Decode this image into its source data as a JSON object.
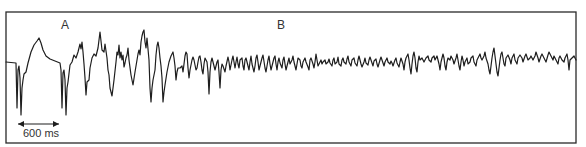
{
  "chart_data": {
    "type": "line",
    "title": "",
    "xlabel": "",
    "ylabel": "",
    "grid": false,
    "legend": null,
    "annotations": [
      {
        "text": "A",
        "x": 65,
        "y": 25,
        "meaning": "segment A: large irregular oscillations"
      },
      {
        "text": "B",
        "x": 281,
        "y": 25,
        "meaning": "segment B: smaller faster regular oscillations"
      },
      {
        "text": "600 ms",
        "type": "time-scale-bar",
        "x1": 18,
        "x2": 59,
        "y": 124
      }
    ],
    "frame": {
      "x": 6,
      "y": 12,
      "width": 570,
      "height": 131
    },
    "segments": [
      {
        "name": "A",
        "x_range_px": [
          6,
          205
        ],
        "description": "high-amplitude irregular waveform"
      },
      {
        "name": "B",
        "x_range_px": [
          205,
          576
        ],
        "description": "low-amplitude rapid oscillations"
      }
    ],
    "points": [
      [
        6,
        62
      ],
      [
        16,
        63
      ],
      [
        17,
        108
      ],
      [
        18,
        70
      ],
      [
        19,
        66
      ],
      [
        20,
        78
      ],
      [
        21,
        115
      ],
      [
        22,
        88
      ],
      [
        23,
        80
      ],
      [
        24,
        74
      ],
      [
        26,
        72
      ],
      [
        28,
        63
      ],
      [
        31,
        52
      ],
      [
        34,
        45
      ],
      [
        37,
        41
      ],
      [
        39,
        38
      ],
      [
        41,
        43
      ],
      [
        43,
        50
      ],
      [
        46,
        56
      ],
      [
        50,
        59
      ],
      [
        55,
        61
      ],
      [
        60,
        63
      ],
      [
        61,
        70
      ],
      [
        62,
        108
      ],
      [
        63,
        73
      ],
      [
        64,
        70
      ],
      [
        65,
        80
      ],
      [
        66,
        115
      ],
      [
        67,
        88
      ],
      [
        68,
        82
      ],
      [
        70,
        65
      ],
      [
        72,
        62
      ],
      [
        74,
        55
      ],
      [
        76,
        58
      ],
      [
        78,
        52
      ],
      [
        80,
        44
      ],
      [
        81,
        49
      ],
      [
        82,
        42
      ],
      [
        83,
        52
      ],
      [
        84,
        64
      ],
      [
        85,
        78
      ],
      [
        86,
        95
      ],
      [
        87,
        82
      ],
      [
        89,
        80
      ],
      [
        90,
        68
      ],
      [
        92,
        58
      ],
      [
        94,
        54
      ],
      [
        96,
        56
      ],
      [
        98,
        48
      ],
      [
        100,
        32
      ],
      [
        102,
        50
      ],
      [
        104,
        52
      ],
      [
        105,
        44
      ],
      [
        107,
        58
      ],
      [
        108,
        70
      ],
      [
        109,
        75
      ],
      [
        110,
        88
      ],
      [
        112,
        96
      ],
      [
        114,
        80
      ],
      [
        116,
        62
      ],
      [
        117,
        52
      ],
      [
        118,
        55
      ],
      [
        119,
        45
      ],
      [
        120,
        58
      ],
      [
        121,
        52
      ],
      [
        122,
        60
      ],
      [
        123,
        55
      ],
      [
        124,
        67
      ],
      [
        125,
        63
      ],
      [
        126,
        58
      ],
      [
        127,
        55
      ],
      [
        128,
        48
      ],
      [
        129,
        60
      ],
      [
        131,
        75
      ],
      [
        133,
        85
      ],
      [
        135,
        72
      ],
      [
        137,
        60
      ],
      [
        138,
        54
      ],
      [
        139,
        50
      ],
      [
        140,
        55
      ],
      [
        141,
        42
      ],
      [
        142,
        36
      ],
      [
        143,
        32
      ],
      [
        144,
        30
      ],
      [
        145,
        42
      ],
      [
        146,
        48
      ],
      [
        147,
        38
      ],
      [
        149,
        60
      ],
      [
        150,
        88
      ],
      [
        151,
        102
      ],
      [
        152,
        88
      ],
      [
        153,
        80
      ],
      [
        155,
        70
      ],
      [
        156,
        55
      ],
      [
        157,
        46
      ],
      [
        158,
        42
      ],
      [
        159,
        48
      ],
      [
        160,
        58
      ],
      [
        161,
        66
      ],
      [
        162,
        78
      ],
      [
        163,
        102
      ],
      [
        164,
        92
      ],
      [
        165,
        85
      ],
      [
        167,
        72
      ],
      [
        169,
        62
      ],
      [
        171,
        56
      ],
      [
        173,
        52
      ],
      [
        174,
        58
      ],
      [
        175,
        66
      ],
      [
        176,
        80
      ],
      [
        177,
        72
      ],
      [
        178,
        68
      ],
      [
        180,
        68
      ],
      [
        182,
        66
      ],
      [
        183,
        72
      ],
      [
        184,
        64
      ],
      [
        185,
        56
      ],
      [
        186,
        52
      ],
      [
        187,
        54
      ],
      [
        188,
        68
      ],
      [
        189,
        78
      ],
      [
        190,
        70
      ],
      [
        192,
        60
      ],
      [
        193,
        57
      ],
      [
        194,
        60
      ],
      [
        195,
        65
      ],
      [
        196,
        70
      ],
      [
        197,
        68
      ],
      [
        198,
        62
      ],
      [
        199,
        57
      ],
      [
        200,
        56
      ],
      [
        201,
        62
      ],
      [
        202,
        70
      ],
      [
        203,
        74
      ],
      [
        204,
        64
      ],
      [
        205,
        58
      ],
      [
        207,
        62
      ],
      [
        208,
        72
      ],
      [
        209,
        94
      ],
      [
        210,
        72
      ],
      [
        211,
        62
      ],
      [
        212,
        58
      ],
      [
        213,
        62
      ],
      [
        215,
        70
      ],
      [
        217,
        62
      ],
      [
        218,
        60
      ],
      [
        219,
        72
      ],
      [
        220,
        88
      ],
      [
        221,
        70
      ],
      [
        222,
        64
      ],
      [
        223,
        66
      ],
      [
        225,
        72
      ],
      [
        226,
        66
      ],
      [
        228,
        57
      ],
      [
        229,
        62
      ],
      [
        230,
        70
      ],
      [
        232,
        60
      ],
      [
        233,
        56
      ],
      [
        234,
        62
      ],
      [
        235,
        68
      ],
      [
        236,
        62
      ],
      [
        237,
        57
      ],
      [
        238,
        64
      ],
      [
        239,
        68
      ],
      [
        240,
        60
      ],
      [
        242,
        58
      ],
      [
        243,
        66
      ],
      [
        244,
        70
      ],
      [
        245,
        60
      ],
      [
        246,
        58
      ],
      [
        248,
        66
      ],
      [
        249,
        70
      ],
      [
        250,
        62
      ],
      [
        251,
        56
      ],
      [
        252,
        64
      ],
      [
        254,
        72
      ],
      [
        255,
        66
      ],
      [
        256,
        58
      ],
      [
        257,
        55
      ],
      [
        258,
        62
      ],
      [
        259,
        70
      ],
      [
        260,
        66
      ],
      [
        262,
        58
      ],
      [
        263,
        55
      ],
      [
        265,
        68
      ],
      [
        266,
        72
      ],
      [
        268,
        60
      ],
      [
        269,
        56
      ],
      [
        270,
        64
      ],
      [
        271,
        70
      ],
      [
        272,
        66
      ],
      [
        274,
        58
      ],
      [
        275,
        56
      ],
      [
        276,
        64
      ],
      [
        277,
        70
      ],
      [
        278,
        62
      ],
      [
        279,
        58
      ],
      [
        280,
        63
      ],
      [
        282,
        68
      ],
      [
        283,
        60
      ],
      [
        284,
        57
      ],
      [
        285,
        64
      ],
      [
        286,
        70
      ],
      [
        288,
        62
      ],
      [
        289,
        58
      ],
      [
        290,
        64
      ],
      [
        292,
        60
      ],
      [
        293,
        56
      ],
      [
        294,
        62
      ],
      [
        296,
        70
      ],
      [
        297,
        64
      ],
      [
        298,
        58
      ],
      [
        300,
        60
      ],
      [
        301,
        66
      ],
      [
        302,
        68
      ],
      [
        303,
        62
      ],
      [
        305,
        58
      ],
      [
        306,
        62
      ],
      [
        308,
        67
      ],
      [
        309,
        70
      ],
      [
        310,
        60
      ],
      [
        311,
        58
      ],
      [
        313,
        64
      ],
      [
        314,
        68
      ],
      [
        315,
        62
      ],
      [
        316,
        54
      ],
      [
        317,
        60
      ],
      [
        318,
        66
      ],
      [
        320,
        62
      ],
      [
        321,
        60
      ],
      [
        322,
        64
      ],
      [
        323,
        62
      ],
      [
        325,
        60
      ],
      [
        326,
        64
      ],
      [
        328,
        62
      ],
      [
        329,
        59
      ],
      [
        330,
        63
      ],
      [
        332,
        66
      ],
      [
        333,
        60
      ],
      [
        334,
        58
      ],
      [
        335,
        64
      ],
      [
        337,
        62
      ],
      [
        338,
        57
      ],
      [
        339,
        64
      ],
      [
        341,
        66
      ],
      [
        342,
        60
      ],
      [
        343,
        58
      ],
      [
        344,
        62
      ],
      [
        346,
        64
      ],
      [
        347,
        59
      ],
      [
        348,
        56
      ],
      [
        349,
        62
      ],
      [
        351,
        66
      ],
      [
        352,
        60
      ],
      [
        354,
        58
      ],
      [
        355,
        63
      ],
      [
        357,
        66
      ],
      [
        358,
        60
      ],
      [
        359,
        56
      ],
      [
        361,
        64
      ],
      [
        362,
        67
      ],
      [
        364,
        62
      ],
      [
        365,
        58
      ],
      [
        366,
        63
      ],
      [
        368,
        65
      ],
      [
        369,
        60
      ],
      [
        370,
        57
      ],
      [
        372,
        63
      ],
      [
        373,
        66
      ],
      [
        374,
        61
      ],
      [
        376,
        59
      ],
      [
        377,
        64
      ],
      [
        378,
        67
      ],
      [
        380,
        60
      ],
      [
        381,
        57
      ],
      [
        383,
        63
      ],
      [
        384,
        66
      ],
      [
        385,
        62
      ],
      [
        387,
        58
      ],
      [
        388,
        62
      ],
      [
        390,
        64
      ],
      [
        391,
        61
      ],
      [
        392,
        63
      ],
      [
        393,
        66
      ],
      [
        395,
        60
      ],
      [
        396,
        58
      ],
      [
        397,
        63
      ],
      [
        399,
        67
      ],
      [
        400,
        62
      ],
      [
        401,
        58
      ],
      [
        403,
        64
      ],
      [
        404,
        70
      ],
      [
        405,
        62
      ],
      [
        406,
        58
      ],
      [
        408,
        54
      ],
      [
        409,
        60
      ],
      [
        410,
        68
      ],
      [
        411,
        74
      ],
      [
        412,
        64
      ],
      [
        413,
        56
      ],
      [
        414,
        52
      ],
      [
        415,
        58
      ],
      [
        416,
        68
      ],
      [
        417,
        72
      ],
      [
        418,
        62
      ],
      [
        419,
        56
      ],
      [
        420,
        60
      ],
      [
        422,
        58
      ],
      [
        424,
        62
      ],
      [
        425,
        60
      ],
      [
        426,
        58
      ],
      [
        428,
        56
      ],
      [
        429,
        60
      ],
      [
        431,
        62
      ],
      [
        432,
        58
      ],
      [
        434,
        56
      ],
      [
        435,
        60
      ],
      [
        437,
        56
      ],
      [
        439,
        64
      ],
      [
        440,
        70
      ],
      [
        441,
        62
      ],
      [
        442,
        58
      ],
      [
        443,
        54
      ],
      [
        444,
        58
      ],
      [
        445,
        66
      ],
      [
        446,
        70
      ],
      [
        447,
        62
      ],
      [
        448,
        58
      ],
      [
        450,
        60
      ],
      [
        451,
        56
      ],
      [
        453,
        60
      ],
      [
        454,
        64
      ],
      [
        456,
        58
      ],
      [
        457,
        54
      ],
      [
        458,
        60
      ],
      [
        459,
        66
      ],
      [
        460,
        70
      ],
      [
        461,
        62
      ],
      [
        462,
        56
      ],
      [
        463,
        60
      ],
      [
        464,
        66
      ],
      [
        465,
        62
      ],
      [
        467,
        58
      ],
      [
        468,
        64
      ],
      [
        470,
        62
      ],
      [
        471,
        58
      ],
      [
        473,
        56
      ],
      [
        474,
        62
      ],
      [
        476,
        66
      ],
      [
        477,
        60
      ],
      [
        478,
        58
      ],
      [
        480,
        54
      ],
      [
        481,
        58
      ],
      [
        482,
        60
      ],
      [
        484,
        56
      ],
      [
        485,
        52
      ],
      [
        486,
        58
      ],
      [
        488,
        64
      ],
      [
        489,
        70
      ],
      [
        490,
        74
      ],
      [
        491,
        66
      ],
      [
        492,
        58
      ],
      [
        493,
        52
      ],
      [
        494,
        48
      ],
      [
        495,
        56
      ],
      [
        496,
        64
      ],
      [
        497,
        72
      ],
      [
        498,
        76
      ],
      [
        499,
        68
      ],
      [
        500,
        60
      ],
      [
        501,
        54
      ],
      [
        502,
        52
      ],
      [
        503,
        58
      ],
      [
        504,
        64
      ],
      [
        505,
        66
      ],
      [
        506,
        58
      ],
      [
        508,
        55
      ],
      [
        510,
        60
      ],
      [
        511,
        64
      ],
      [
        512,
        58
      ],
      [
        514,
        54
      ],
      [
        515,
        60
      ],
      [
        517,
        64
      ],
      [
        518,
        58
      ],
      [
        520,
        55
      ],
      [
        522,
        58
      ],
      [
        523,
        62
      ],
      [
        525,
        56
      ],
      [
        526,
        54
      ],
      [
        528,
        60
      ],
      [
        530,
        58
      ],
      [
        531,
        56
      ],
      [
        533,
        60
      ],
      [
        535,
        56
      ],
      [
        536,
        52
      ],
      [
        538,
        58
      ],
      [
        539,
        62
      ],
      [
        541,
        56
      ],
      [
        542,
        54
      ],
      [
        544,
        58
      ],
      [
        546,
        62
      ],
      [
        548,
        55
      ],
      [
        549,
        52
      ],
      [
        551,
        56
      ],
      [
        553,
        60
      ],
      [
        554,
        56
      ],
      [
        556,
        60
      ],
      [
        558,
        64
      ],
      [
        559,
        58
      ],
      [
        560,
        56
      ],
      [
        562,
        60
      ],
      [
        564,
        62
      ],
      [
        565,
        58
      ],
      [
        567,
        54
      ],
      [
        568,
        60
      ],
      [
        569,
        70
      ],
      [
        570,
        60
      ],
      [
        572,
        58
      ],
      [
        574,
        56
      ],
      [
        576,
        60
      ]
    ]
  }
}
